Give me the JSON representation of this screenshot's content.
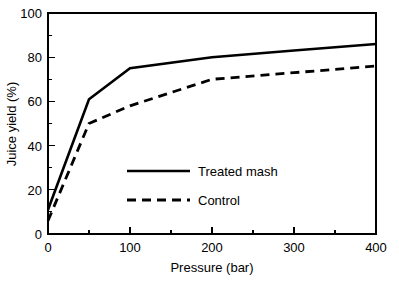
{
  "chart_data": {
    "type": "line",
    "title": "",
    "xlabel": "Pressure (bar)",
    "ylabel": "Juice yield (%)",
    "xlim": [
      0,
      400
    ],
    "ylim": [
      0,
      100
    ],
    "grid": false,
    "legend_position": "center",
    "x_ticks_major": [
      0,
      100,
      200,
      300,
      400
    ],
    "x_ticks_minor": [
      50,
      150,
      250,
      350
    ],
    "y_ticks_major": [
      0,
      20,
      40,
      60,
      80,
      100
    ],
    "y_ticks_minor": [
      10,
      30,
      50,
      70,
      90
    ],
    "x_tick_labels": [
      "0",
      "100",
      "200",
      "300",
      "400"
    ],
    "y_tick_labels": [
      "0",
      "20",
      "40",
      "60",
      "80",
      "100"
    ],
    "series": [
      {
        "name": "Treated mash",
        "style": "solid",
        "color": "#000000",
        "x": [
          0,
          50,
          100,
          200,
          300,
          400
        ],
        "values": [
          11,
          61,
          75,
          80,
          83,
          86
        ]
      },
      {
        "name": "Control",
        "style": "dashed",
        "color": "#000000",
        "x": [
          0,
          50,
          100,
          200,
          300,
          400
        ],
        "values": [
          6,
          50,
          58,
          70,
          73,
          76
        ]
      }
    ],
    "legend": [
      {
        "label": "Treated mash",
        "style": "solid"
      },
      {
        "label": "Control",
        "style": "dashed"
      }
    ]
  },
  "axes": {
    "x_title": "Pressure (bar)",
    "y_title": "Juice yield (%)"
  },
  "legend": {
    "entry_0_label": "Treated mash",
    "entry_1_label": "Control"
  },
  "x_labels": {
    "t0": "0",
    "t1": "100",
    "t2": "200",
    "t3": "300",
    "t4": "400"
  },
  "y_labels": {
    "t0": "0",
    "t1": "20",
    "t2": "40",
    "t3": "60",
    "t4": "80",
    "t5": "100"
  },
  "colors": {
    "background": "#ffffff",
    "foreground": "#000000"
  }
}
